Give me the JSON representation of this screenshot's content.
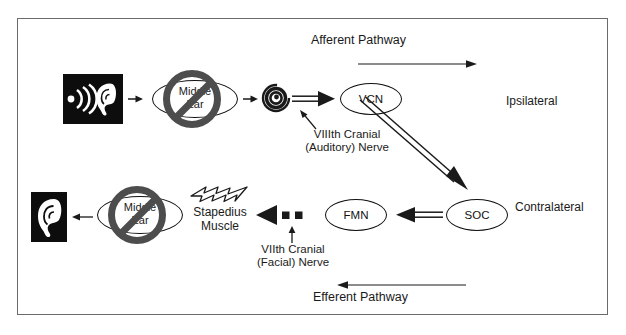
{
  "diagram": {
    "frame": {
      "border_color": "#6b6b6b"
    },
    "pathways": {
      "afferent_label": "Afferent Pathway",
      "efferent_label": "Efferent Pathway"
    },
    "sides": {
      "ipsilateral": "Ipsilateral",
      "contralateral": "Contralateral"
    },
    "nuclei": {
      "vcn": "VCN",
      "soc": "SOC",
      "fmn": "FMN"
    },
    "structures": {
      "middle_ear_top": "Middle\nEar",
      "middle_ear_top_line1": "Middle",
      "middle_ear_top_line2": "Ear",
      "middle_ear_bottom_line1": "Middle",
      "middle_ear_bottom_line2": "Ear",
      "stapedius_line1": "Stapedius",
      "stapedius_line2": "Muscle"
    },
    "nerves": {
      "auditory_line1": "VIIIth Cranial",
      "auditory_line2": "(Auditory) Nerve",
      "facial_line1": "VIIth Cranial",
      "facial_line2": "(Facial) Nerve"
    },
    "icons": {
      "sound_ear": "sound-wave-ear-icon",
      "ear": "ear-icon",
      "cochlea": "cochlea-spiral-icon",
      "lightning": "lightning-bolt-icon",
      "prohibition": "prohibition-sign-icon"
    },
    "colors": {
      "stroke": "#111111",
      "prohibition_gray": "#4d4d4d",
      "frame": "#6b6b6b",
      "icon_black": "#0d0d0d"
    }
  }
}
